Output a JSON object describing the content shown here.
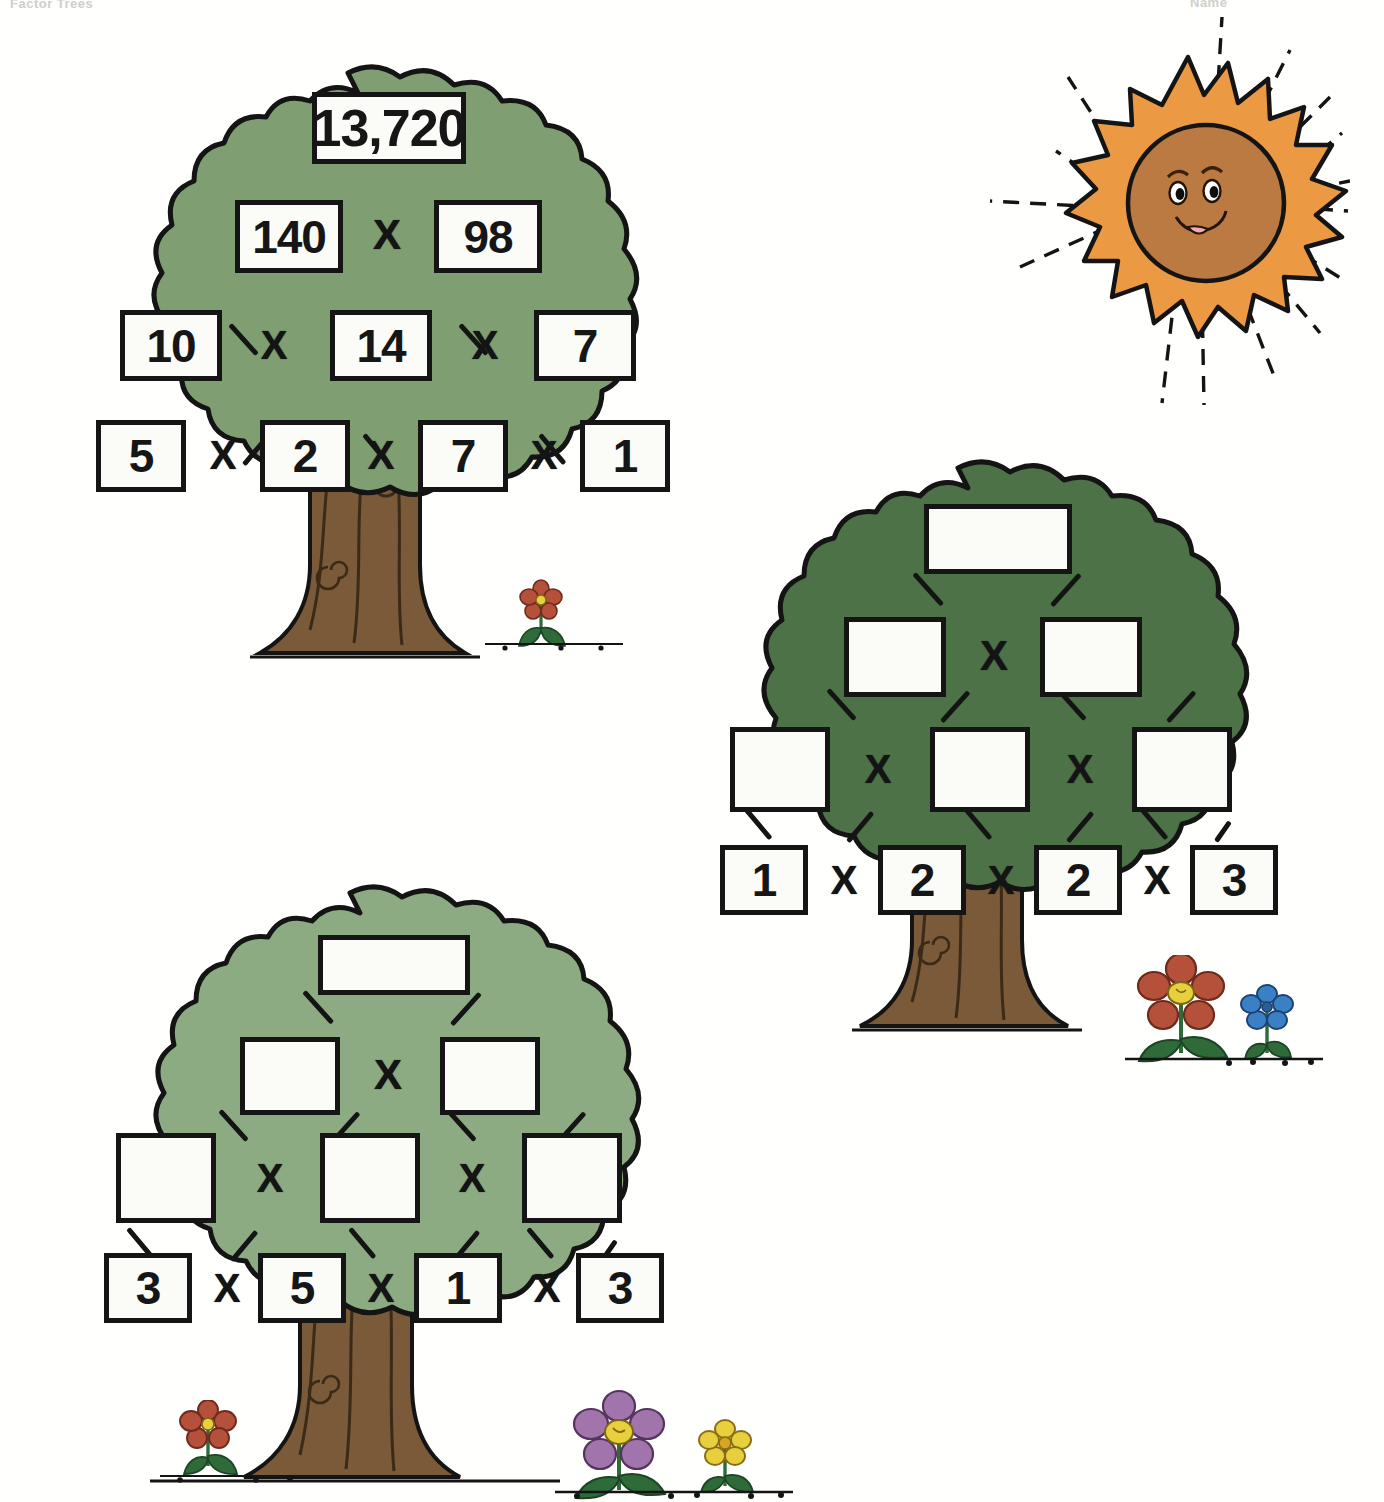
{
  "page": {
    "title_crop_left": "Factor Trees",
    "title_crop_right": "Name",
    "background": "#fffffd"
  },
  "colors": {
    "foliage_light": "#7f9e72",
    "foliage_dark": "#4e7248",
    "foliage_pale": "#8dab83",
    "trunk": "#7a5a38",
    "outline": "#141414",
    "box_fill": "#fbfbf7",
    "sun_ray": "#eb9a43",
    "sun_face": "#bb7a42",
    "flower_red": "#b5503a",
    "flower_blue": "#3b7fc4",
    "flower_purple": "#a174ab",
    "flower_yellow": "#e8cf3e",
    "leaf_green": "#2f6b39"
  },
  "trees": [
    {
      "id": "tree-1",
      "name": "factor-tree-solved",
      "foliage": "#7f9e72",
      "operator": "X",
      "rows": [
        {
          "row": 0,
          "cells": [
            {
              "value": "13,720",
              "filled": true
            }
          ],
          "operators": []
        },
        {
          "row": 1,
          "cells": [
            {
              "value": "140",
              "filled": true
            },
            {
              "value": "98",
              "filled": true
            }
          ],
          "operators": [
            "X"
          ]
        },
        {
          "row": 2,
          "cells": [
            {
              "value": "10",
              "filled": true
            },
            {
              "value": "14",
              "filled": true
            },
            {
              "value": "7",
              "filled": true
            }
          ],
          "operators": [
            "X",
            "X"
          ]
        },
        {
          "row": 3,
          "cells": [
            {
              "value": "5",
              "filled": true
            },
            {
              "value": "2",
              "filled": true
            },
            {
              "value": "7",
              "filled": true
            },
            {
              "value": "1",
              "filled": true
            }
          ],
          "operators": [
            "X",
            "X",
            "X"
          ]
        }
      ]
    },
    {
      "id": "tree-2",
      "name": "factor-tree-blank-a",
      "foliage": "#4e7248",
      "operator": "X",
      "rows": [
        {
          "row": 0,
          "cells": [
            {
              "value": "",
              "filled": false
            }
          ],
          "operators": []
        },
        {
          "row": 1,
          "cells": [
            {
              "value": "",
              "filled": false
            },
            {
              "value": "",
              "filled": false
            }
          ],
          "operators": [
            "X"
          ]
        },
        {
          "row": 2,
          "cells": [
            {
              "value": "",
              "filled": false
            },
            {
              "value": "",
              "filled": false
            },
            {
              "value": "",
              "filled": false
            }
          ],
          "operators": [
            "X",
            "X"
          ]
        },
        {
          "row": 3,
          "cells": [
            {
              "value": "1",
              "filled": true
            },
            {
              "value": "2",
              "filled": true
            },
            {
              "value": "2",
              "filled": true
            },
            {
              "value": "3",
              "filled": true
            }
          ],
          "operators": [
            "X",
            "X",
            "X"
          ]
        }
      ]
    },
    {
      "id": "tree-3",
      "name": "factor-tree-blank-b",
      "foliage": "#8dab83",
      "operator": "X",
      "rows": [
        {
          "row": 0,
          "cells": [
            {
              "value": "",
              "filled": false
            }
          ],
          "operators": []
        },
        {
          "row": 1,
          "cells": [
            {
              "value": "",
              "filled": false
            },
            {
              "value": "",
              "filled": false
            }
          ],
          "operators": [
            "X"
          ]
        },
        {
          "row": 2,
          "cells": [
            {
              "value": "",
              "filled": false
            },
            {
              "value": "",
              "filled": false
            },
            {
              "value": "",
              "filled": false
            }
          ],
          "operators": [
            "X",
            "X"
          ]
        },
        {
          "row": 3,
          "cells": [
            {
              "value": "3",
              "filled": true
            },
            {
              "value": "5",
              "filled": true
            },
            {
              "value": "1",
              "filled": true
            },
            {
              "value": "3",
              "filled": true
            }
          ],
          "operators": [
            "X",
            "X",
            "X"
          ]
        }
      ]
    }
  ],
  "decorations": [
    {
      "name": "sun-illustration",
      "type": "sun",
      "expression": "smiling"
    },
    {
      "name": "flower-red-small",
      "type": "flower",
      "color": "#b5503a"
    },
    {
      "name": "flower-red-large",
      "type": "flower",
      "color": "#b5503a"
    },
    {
      "name": "flower-blue-small",
      "type": "flower",
      "color": "#3b7fc4"
    },
    {
      "name": "flower-purple-large",
      "type": "flower",
      "color": "#a174ab"
    },
    {
      "name": "flower-yellow-small",
      "type": "flower",
      "color": "#e8cf3e"
    },
    {
      "name": "flower-red-tiny",
      "type": "flower",
      "color": "#b5503a"
    }
  ]
}
